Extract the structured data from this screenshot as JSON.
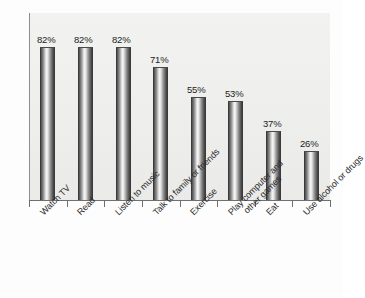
{
  "chart_data": {
    "type": "bar",
    "title": "",
    "subtitle": "",
    "xlabel": "",
    "ylabel": "",
    "ylim": [
      0,
      100
    ],
    "grid": false,
    "legend": "none",
    "orientation": "vertical",
    "value_suffix": "%",
    "categories": [
      "Watch TV",
      "Read",
      "Listen to music",
      "Talk to family or friends",
      "Exercise",
      "Play computer and other games",
      "Eat",
      "Use alcohol or drugs"
    ],
    "values": [
      82,
      82,
      82,
      71,
      55,
      53,
      37,
      26
    ],
    "value_labels": [
      "82%",
      "82%",
      "82%",
      "71%",
      "55%",
      "53%",
      "37%",
      "26%"
    ],
    "colors": {
      "bar_dark": "#3d3d3d",
      "bar_highlight": "#f6f6f6",
      "plot_background": "#efefed",
      "axis": "#6f6f6f",
      "text": "#1c1c1c"
    }
  },
  "categories_wrapped": [
    {
      "line1": "Watch TV",
      "line2": ""
    },
    {
      "line1": "Read",
      "line2": ""
    },
    {
      "line1": "Listen to music",
      "line2": ""
    },
    {
      "line1": "Talk to family or friends",
      "line2": ""
    },
    {
      "line1": "Exercise",
      "line2": ""
    },
    {
      "line1": "Play computer and",
      "line2": "other games"
    },
    {
      "line1": "Eat",
      "line2": ""
    },
    {
      "line1": "Use alcohol or drugs",
      "line2": ""
    }
  ]
}
